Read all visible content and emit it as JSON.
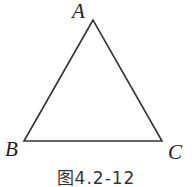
{
  "figure": {
    "caption": "图4.2-12",
    "shape": "triangle",
    "vertices": [
      {
        "label": "A",
        "x": 93,
        "y": 20
      },
      {
        "label": "B",
        "x": 24,
        "y": 141
      },
      {
        "label": "C",
        "x": 162,
        "y": 141
      }
    ],
    "stroke_color": "#333333"
  }
}
